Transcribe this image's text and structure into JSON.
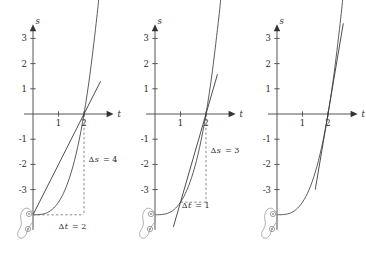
{
  "figure": {
    "title": "",
    "panel_count": 3,
    "background_color": "#ffffff",
    "curve_color": "#4a4a4a",
    "axis_color": "#555555",
    "dash_color": "#6b6b6b"
  },
  "chart_data": [
    {
      "type": "line",
      "panel_index": 1,
      "title": "",
      "xlabel": "t",
      "ylabel": "s",
      "xlim": [
        -0.35,
        3.2
      ],
      "ylim": [
        -4.6,
        3.6
      ],
      "xticks": [
        1,
        2
      ],
      "xtick_labels": [
        "1",
        "2"
      ],
      "yticks": [
        3,
        2,
        1,
        -1,
        -2,
        -3
      ],
      "ytick_labels": [
        "3",
        "2",
        "1",
        "-1",
        "-2",
        "-3"
      ],
      "grid": false,
      "legend": "none",
      "series": [
        {
          "name": "curve",
          "kind": "cubic",
          "expression": "s = t^3/2 - 4",
          "x": [
            0,
            0.25,
            0.5,
            0.75,
            1,
            1.25,
            1.5,
            1.75,
            2,
            2.25,
            2.5,
            2.6
          ],
          "values": [
            -4,
            -3.99,
            -3.94,
            -3.79,
            -3.5,
            -3.02,
            -2.31,
            -1.32,
            0,
            1.7,
            3.81,
            4.79
          ]
        },
        {
          "name": "secant",
          "kind": "line",
          "through": [
            [
              0,
              -4
            ],
            [
              2,
              0
            ]
          ],
          "slope": 2,
          "x": [
            0,
            2,
            2.65
          ],
          "values": [
            -4,
            0,
            1.3
          ]
        }
      ],
      "annotations": [
        {
          "name": "delta-s",
          "text": "Δs = 4",
          "symbol": "Δ",
          "var": "s",
          "value": 4,
          "at": [
            2.18,
            -1.9
          ]
        },
        {
          "name": "delta-t",
          "text": "Δt = 2",
          "symbol": "Δ",
          "var": "t",
          "value": 2,
          "at": [
            1.0,
            -4.55
          ]
        }
      ],
      "dashed_guides": [
        {
          "name": "vertical-delta-s",
          "from": [
            2,
            0
          ],
          "to": [
            2,
            -4
          ]
        },
        {
          "name": "horizontal-delta-t",
          "from": [
            0,
            -4
          ],
          "to": [
            2,
            -4
          ]
        }
      ]
    },
    {
      "type": "line",
      "panel_index": 2,
      "title": "",
      "xlabel": "t",
      "ylabel": "s",
      "xlim": [
        -0.35,
        3.2
      ],
      "ylim": [
        -4.6,
        3.6
      ],
      "xticks": [
        1,
        2
      ],
      "xtick_labels": [
        "1",
        "2"
      ],
      "yticks": [
        3,
        2,
        1,
        -1,
        -2,
        -3
      ],
      "ytick_labels": [
        "3",
        "2",
        "1",
        "-1",
        "-2",
        "-3"
      ],
      "grid": false,
      "legend": "none",
      "series": [
        {
          "name": "curve",
          "kind": "cubic",
          "expression": "s = t^3/2 - 4",
          "x": [
            0,
            0.25,
            0.5,
            0.75,
            1,
            1.25,
            1.5,
            1.75,
            2,
            2.25,
            2.5,
            2.6
          ],
          "values": [
            -4,
            -3.99,
            -3.94,
            -3.79,
            -3.5,
            -3.02,
            -2.31,
            -1.32,
            0,
            1.7,
            3.81,
            4.79
          ]
        },
        {
          "name": "secant",
          "kind": "line",
          "through": [
            [
              1,
              -3.5
            ],
            [
              2,
              0
            ]
          ],
          "slope": 3.5,
          "x": [
            0.72,
            2,
            2.45
          ],
          "values": [
            -4.48,
            0,
            1.58
          ]
        }
      ],
      "annotations": [
        {
          "name": "delta-s",
          "text": "Δs = 3",
          "symbol": "Δ",
          "var": "s",
          "value": 3,
          "at": [
            2.18,
            -1.55
          ]
        },
        {
          "name": "delta-t",
          "text": "Δt = 1",
          "symbol": "Δ",
          "var": "t",
          "value": 1,
          "at": [
            1.05,
            -3.72
          ]
        }
      ],
      "dashed_guides": [
        {
          "name": "vertical-delta-s",
          "from": [
            2,
            0
          ],
          "to": [
            2,
            -3.5
          ]
        },
        {
          "name": "horizontal-delta-t",
          "from": [
            1,
            -3.5
          ],
          "to": [
            2,
            -3.5
          ]
        }
      ]
    },
    {
      "type": "line",
      "panel_index": 3,
      "title": "",
      "xlabel": "t",
      "ylabel": "s",
      "xlim": [
        -0.35,
        3.2
      ],
      "ylim": [
        -4.6,
        3.6
      ],
      "xticks": [
        1,
        2
      ],
      "xtick_labels": [
        "1",
        "2"
      ],
      "yticks": [
        3,
        2,
        1,
        -1,
        -2,
        -3
      ],
      "ytick_labels": [
        "3",
        "2",
        "1",
        "-1",
        "-2",
        "-3"
      ],
      "grid": false,
      "legend": "none",
      "series": [
        {
          "name": "curve",
          "kind": "cubic",
          "expression": "s = t^3/2 - 4",
          "x": [
            0,
            0.25,
            0.5,
            0.75,
            1,
            1.25,
            1.5,
            1.75,
            2,
            2.25,
            2.5,
            2.6
          ],
          "values": [
            -4,
            -3.99,
            -3.94,
            -3.79,
            -3.5,
            -3.02,
            -2.31,
            -1.32,
            0,
            1.7,
            3.81,
            4.79
          ]
        },
        {
          "name": "tangent",
          "kind": "line",
          "through": [
            [
              2,
              0
            ]
          ],
          "slope": 6,
          "x": [
            1.5,
            2,
            2.6
          ],
          "values": [
            -3,
            0,
            3.6
          ]
        }
      ],
      "annotations": [],
      "dashed_guides": []
    }
  ],
  "decoration": {
    "blob": {
      "name": "ink-blot-figure",
      "description": "faint irregular hand-drawn blot with two small ringed dots",
      "color": "#9a9a9a",
      "dot_count": 2
    }
  }
}
